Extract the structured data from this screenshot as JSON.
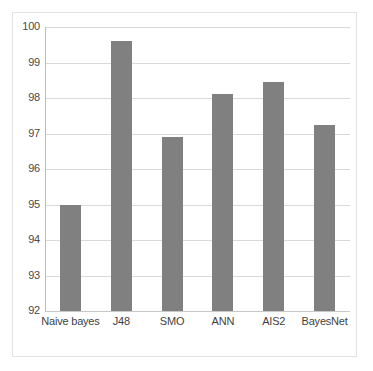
{
  "chart_data": {
    "type": "bar",
    "title": "",
    "subtitle": "",
    "xlabel": "",
    "ylabel": "",
    "categories": [
      "Naive bayes",
      "J48",
      "SMO",
      "ANN",
      "AIS2",
      "BayesNet"
    ],
    "values": [
      95.0,
      99.6,
      96.9,
      98.1,
      98.45,
      97.25
    ],
    "series": [
      {
        "name": "",
        "values": [
          95.0,
          99.6,
          96.9,
          98.1,
          98.45,
          97.25
        ]
      }
    ],
    "ylim": [
      92,
      100
    ],
    "ytick_labels": [
      "100",
      "99",
      "98",
      "97",
      "96",
      "95",
      "94",
      "93",
      "92"
    ],
    "ytick_values": [
      100,
      99,
      98,
      97,
      96,
      95,
      94,
      93,
      92
    ],
    "ytick_step": 1,
    "grid": true,
    "grid_axis": "y",
    "legend": false,
    "legend_position": "none",
    "bar_color": "#808080",
    "gridline_color": "#d9d9d9",
    "axis_color": "#bdbdbd",
    "frame_color": "#e2e2e2",
    "background_color": "#ffffff",
    "tick_label_color": "#4a4a4a"
  }
}
